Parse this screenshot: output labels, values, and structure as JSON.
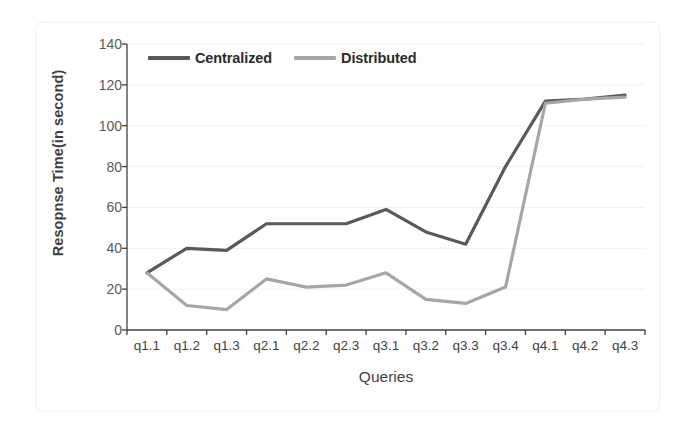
{
  "chart_data": {
    "type": "line",
    "title": "",
    "xlabel": "Queries",
    "ylabel": "Resopnse Time(in second)",
    "categories": [
      "q1.1",
      "q1.2",
      "q1.3",
      "q2.1",
      "q2.2",
      "q2.3",
      "q3.1",
      "q3.2",
      "q3.3",
      "q3.4",
      "q4.1",
      "q4.2",
      "q4.3"
    ],
    "series": [
      {
        "name": "Centralized",
        "color": "#595959",
        "values": [
          28,
          40,
          39,
          52,
          52,
          52,
          59,
          48,
          42,
          80,
          112,
          113,
          115
        ]
      },
      {
        "name": "Distributed",
        "color": "#a6a6a6",
        "values": [
          28,
          12,
          10,
          25,
          21,
          22,
          28,
          15,
          13,
          21,
          111,
          113,
          114
        ]
      }
    ],
    "ylim": [
      0,
      140
    ],
    "yticks": [
      0,
      20,
      40,
      60,
      80,
      100,
      120,
      140
    ],
    "ytick_labels": [
      "0",
      "20",
      "40",
      "60",
      "80",
      "100",
      "120",
      "140"
    ],
    "grid": "horizontal",
    "legend_position": "top-left-inside",
    "axis_color": "#404040",
    "gridline_color": "#f2f2f2",
    "background": "#ffffff"
  },
  "legend": {
    "items": [
      {
        "label": "Centralized",
        "color": "#595959"
      },
      {
        "label": "Distributed",
        "color": "#a6a6a6"
      }
    ]
  },
  "axes": {
    "y_title": "Resopnse Time(in second)",
    "x_title": "Queries"
  }
}
